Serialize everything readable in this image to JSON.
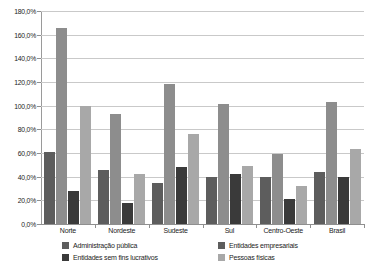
{
  "chart_data": {
    "type": "bar",
    "title": "",
    "subtitle": "",
    "xlabel": "",
    "ylabel": "",
    "grid": true,
    "legend_position": "bottom",
    "ylim": [
      0,
      180
    ],
    "ytick_labels": [
      "0,0%",
      "20,0%",
      "40,0%",
      "60,0%",
      "80,0%",
      "100,0%",
      "120,0%",
      "140,0%",
      "160,0%",
      "180,0%"
    ],
    "ytick_values": [
      0,
      20,
      40,
      60,
      80,
      100,
      120,
      140,
      160,
      180
    ],
    "categories": [
      "Norte",
      "Nordeste",
      "Sudeste",
      "Sul",
      "Centro-Oeste",
      "Brasil"
    ],
    "series": [
      {
        "name": "Administração pública",
        "color": "#5d5d5d",
        "values": [
          61.0,
          46.0,
          35.0,
          40.0,
          40.0,
          44.0
        ]
      },
      {
        "name": "Entidades sem fins lucrativos",
        "color": "#8d8d8d",
        "values": [
          166.0,
          93.0,
          118.0,
          101.0,
          59.0,
          103.0
        ]
      },
      {
        "name": "Entidades empresariais",
        "color": "#3a3a3a",
        "values": [
          28.0,
          18.0,
          48.5,
          42.0,
          21.0,
          40.0
        ]
      },
      {
        "name": "Pessoas físicas",
        "color": "#a8a8a8",
        "values": [
          100.0,
          42.0,
          76.0,
          49.0,
          32.0,
          63.0
        ]
      }
    ]
  },
  "legend": {
    "items": [
      {
        "label": "Administração pública",
        "color": "#5d5d5d"
      },
      {
        "label": "Entidades sem fins lucrativos",
        "color": "#3a3a3a"
      },
      {
        "label": "Entidades empresariais",
        "color": "#5d5d5d"
      },
      {
        "label": "Pessoas físicas",
        "color": "#a8a8a8"
      }
    ]
  }
}
